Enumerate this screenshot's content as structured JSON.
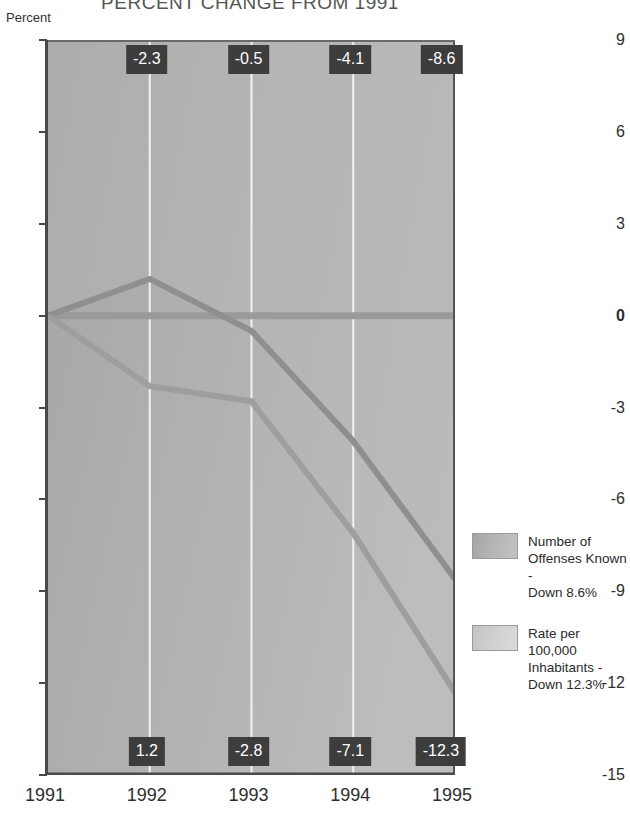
{
  "chart_data": {
    "type": "area",
    "title": "PERCENT CHANGE FROM 1991",
    "xlabel": "",
    "ylabel": "Percent",
    "categories": [
      "1991",
      "1992",
      "1993",
      "1994",
      "1995"
    ],
    "x": [
      1991,
      1992,
      1993,
      1994,
      1995
    ],
    "ylim": [
      -15,
      9
    ],
    "yticks": [
      9,
      6,
      3,
      0,
      -3,
      -6,
      -9,
      -12,
      -15
    ],
    "ytick_labels": [
      "9",
      "6",
      "3",
      "0",
      "-3",
      "-6",
      "-9",
      "-12",
      "-15"
    ],
    "grid": "vertical",
    "legend_position": "right",
    "series": [
      {
        "name": "Number of Offenses Known - Down 8.6%",
        "short_name": "Number of Offenses Known",
        "values": [
          0,
          1.2,
          -0.5,
          -4.1,
          -8.6
        ],
        "point_labels": [
          "",
          "-2.3",
          "-0.5",
          "-4.1",
          "-8.6"
        ],
        "label_position": "top",
        "color": "#b0b0b0"
      },
      {
        "name": "Rate per 100,000 Inhabitants - Down 12.3%",
        "short_name": "Rate per 100,000 Inhabitants",
        "values": [
          0,
          -2.3,
          -2.8,
          -7.1,
          -12.3
        ],
        "point_labels": [
          "",
          "1.2",
          "-2.8",
          "-7.1",
          "-12.3"
        ],
        "label_position": "bottom",
        "color": "#cfcfcf"
      }
    ],
    "top_labels": [
      {
        "x": "1992",
        "text": "-2.3"
      },
      {
        "x": "1993",
        "text": "-0.5"
      },
      {
        "x": "1994",
        "text": "-4.1"
      },
      {
        "x": "1995",
        "text": "-8.6"
      }
    ],
    "bottom_labels": [
      {
        "x": "1992",
        "text": "1.2"
      },
      {
        "x": "1993",
        "text": "-2.8"
      },
      {
        "x": "1994",
        "text": "-7.1"
      },
      {
        "x": "1995",
        "text": "-12.3"
      }
    ],
    "label_badge_color": "#3d3d3d",
    "label_text_color": "#ffffff",
    "plot_background": "#b4b4b4"
  },
  "legend": {
    "items": [
      {
        "line1": "Number of",
        "line2": "Offenses Known -",
        "line3": "Down 8.6%",
        "swatch": "offenses-swatch"
      },
      {
        "line1": "Rate per 100,000",
        "line2": "Inhabitants -",
        "line3": "Down 12.3%",
        "swatch": "rate-swatch"
      }
    ]
  }
}
